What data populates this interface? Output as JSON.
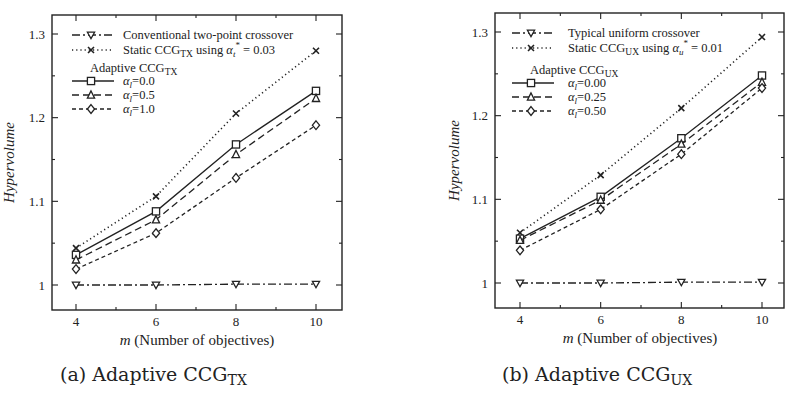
{
  "chart_data": [
    {
      "type": "line",
      "panel": "a",
      "caption": {
        "prefix": "(a) Adaptive CCG",
        "sub": "TX"
      },
      "xlabel": {
        "italic": "m",
        "rest": " (Number of objectives)"
      },
      "ylabel": "Hypervolume",
      "x": [
        4,
        6,
        8,
        10
      ],
      "xticks": [
        "4",
        "6",
        "8",
        "10"
      ],
      "yticks": [
        "1",
        "1.1",
        "1.2",
        "1.3"
      ],
      "ylim": [
        0.98,
        1.32
      ],
      "grid": false,
      "legend_position": "upper left",
      "series": [
        {
          "name": "Conventional two-point crossover",
          "marker": "triangle-down",
          "dash": "dashdot",
          "values": [
            1.0,
            1.0,
            1.001,
            1.001
          ]
        },
        {
          "name": "Static CCG_TX using α_t* = 0.03",
          "marker": "x",
          "dash": "dotted",
          "values": [
            1.044,
            1.106,
            1.205,
            1.28
          ]
        },
        {
          "name": "α_l=0.0",
          "group": "Adaptive CCG_TX",
          "marker": "square",
          "dash": "solid",
          "values": [
            1.036,
            1.088,
            1.168,
            1.232
          ]
        },
        {
          "name": "α_l=0.5",
          "group": "Adaptive CCG_TX",
          "marker": "triangle-up",
          "dash": "dashed",
          "values": [
            1.03,
            1.078,
            1.156,
            1.223
          ]
        },
        {
          "name": "α_l=1.0",
          "group": "Adaptive CCG_TX",
          "marker": "diamond",
          "dash": "shortdash",
          "values": [
            1.019,
            1.062,
            1.128,
            1.191
          ]
        }
      ],
      "legend": {
        "rows": [
          {
            "series": 0,
            "text": "Conventional two-point crossover"
          },
          {
            "series": 1,
            "text_parts": [
              "Static CCG",
              "TX",
              " using ",
              "α",
              "t",
              "*",
              " = 0.03"
            ]
          },
          {
            "title": true,
            "text_parts": [
              "Adaptive CCG",
              "TX"
            ]
          },
          {
            "series": 2,
            "text_parts": [
              "α",
              "l",
              "=0.0"
            ]
          },
          {
            "series": 3,
            "text_parts": [
              "α",
              "l",
              "=0.5"
            ]
          },
          {
            "series": 4,
            "text_parts": [
              "α",
              "l",
              "=1.0"
            ]
          }
        ]
      }
    },
    {
      "type": "line",
      "panel": "b",
      "caption": {
        "prefix": "(b) Adaptive CCG",
        "sub": "UX"
      },
      "xlabel": {
        "italic": "m",
        "rest": " (Number of objectives)"
      },
      "ylabel": "Hypervolume",
      "x": [
        4,
        6,
        8,
        10
      ],
      "xticks": [
        "4",
        "6",
        "8",
        "10"
      ],
      "yticks": [
        "1",
        "1.1",
        "1.2",
        "1.3"
      ],
      "ylim": [
        0.98,
        1.32
      ],
      "grid": false,
      "legend_position": "upper left",
      "series": [
        {
          "name": "Typical uniform crossover",
          "marker": "triangle-down",
          "dash": "dashdot",
          "values": [
            1.0,
            1.0,
            1.001,
            1.001
          ]
        },
        {
          "name": "Static CCG_UX using α_u* = 0.01",
          "marker": "x",
          "dash": "dotted",
          "values": [
            1.06,
            1.129,
            1.209,
            1.294
          ]
        },
        {
          "name": "α_l=0.00",
          "group": "Adaptive CCG_UX",
          "marker": "square",
          "dash": "solid",
          "values": [
            1.053,
            1.103,
            1.173,
            1.248
          ]
        },
        {
          "name": "α_l=0.25",
          "group": "Adaptive CCG_UX",
          "marker": "triangle-up",
          "dash": "dashed",
          "values": [
            1.051,
            1.099,
            1.166,
            1.24
          ]
        },
        {
          "name": "α_l=0.50",
          "group": "Adaptive CCG_UX",
          "marker": "diamond",
          "dash": "shortdash",
          "values": [
            1.039,
            1.088,
            1.154,
            1.233
          ]
        }
      ],
      "legend": {
        "rows": [
          {
            "series": 0,
            "text": "Typical uniform crossover"
          },
          {
            "series": 1,
            "text_parts": [
              "Static CCG",
              "UX",
              " using ",
              "α",
              "u",
              "*",
              " = 0.01"
            ]
          },
          {
            "title": true,
            "text_parts": [
              "Adaptive CCG",
              "UX"
            ]
          },
          {
            "series": 2,
            "text_parts": [
              "α",
              "l",
              "=0.00"
            ]
          },
          {
            "series": 3,
            "text_parts": [
              "α",
              "l",
              "=0.25"
            ]
          },
          {
            "series": 4,
            "text_parts": [
              "α",
              "l",
              "=0.50"
            ]
          }
        ]
      }
    }
  ],
  "style": {
    "ink": "#222222",
    "background": "#ffffff"
  }
}
